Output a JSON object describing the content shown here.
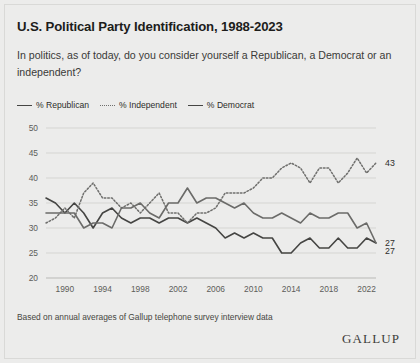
{
  "title": "U.S. Political Party Identification, 1988-2023",
  "subtitle": "In politics, as of today, do you consider yourself a Republican, a Democrat or an independent?",
  "footnote": "Based on annual averages of Gallup telephone survey interview data",
  "brand": "GALLUP",
  "legend": {
    "items": [
      {
        "label": "% Republican",
        "style": "solid",
        "color": "#454543"
      },
      {
        "label": "% Independent",
        "style": "dotted",
        "color": "#6f6f6d"
      },
      {
        "label": "% Democrat",
        "style": "solid",
        "color": "#6b6b69"
      }
    ]
  },
  "end_labels": {
    "independent": "43",
    "republican": "27",
    "democrat": "27"
  },
  "chart_data": {
    "type": "line",
    "title": "U.S. Political Party Identification, 1988-2023",
    "subtitle": "In politics, as of today, do you consider yourself a Republican, a Democrat or an independent?",
    "xlabel": "",
    "ylabel": "",
    "xlim": [
      1988,
      2023
    ],
    "ylim": [
      20,
      50
    ],
    "yticks": [
      20,
      25,
      30,
      35,
      40,
      45,
      50
    ],
    "xticks": [
      1990,
      1994,
      1998,
      2002,
      2006,
      2010,
      2014,
      2018,
      2022
    ],
    "grid": true,
    "legend_position": "above-plot",
    "x": [
      1988,
      1989,
      1990,
      1991,
      1992,
      1993,
      1994,
      1995,
      1996,
      1997,
      1998,
      1999,
      2000,
      2001,
      2002,
      2003,
      2004,
      2005,
      2006,
      2007,
      2008,
      2009,
      2010,
      2011,
      2012,
      2013,
      2014,
      2015,
      2016,
      2017,
      2018,
      2019,
      2020,
      2021,
      2022,
      2023
    ],
    "series": [
      {
        "name": "% Republican",
        "style": "solid",
        "color": "#454543",
        "end_label": "27",
        "values": [
          36,
          35,
          33,
          35,
          33,
          30,
          33,
          34,
          32,
          31,
          32,
          32,
          31,
          32,
          32,
          31,
          32,
          31,
          30,
          28,
          29,
          28,
          29,
          28,
          28,
          25,
          25,
          27,
          28,
          26,
          26,
          28,
          26,
          26,
          28,
          27
        ]
      },
      {
        "name": "% Independent",
        "style": "dotted",
        "color": "#6f6f6d",
        "end_label": "43",
        "values": [
          31,
          32,
          34,
          32,
          37,
          39,
          36,
          36,
          34,
          35,
          33,
          35,
          37,
          33,
          33,
          31,
          33,
          33,
          34,
          37,
          37,
          37,
          38,
          40,
          40,
          42,
          43,
          42,
          39,
          42,
          42,
          39,
          41,
          44,
          41,
          43
        ]
      },
      {
        "name": "% Democrat",
        "style": "solid",
        "color": "#6b6b69",
        "end_label": "27",
        "values": [
          33,
          33,
          33,
          33,
          30,
          31,
          31,
          30,
          34,
          34,
          35,
          33,
          32,
          35,
          35,
          38,
          35,
          36,
          36,
          35,
          34,
          35,
          33,
          32,
          32,
          33,
          32,
          31,
          33,
          32,
          32,
          33,
          33,
          30,
          31,
          27
        ]
      }
    ]
  }
}
